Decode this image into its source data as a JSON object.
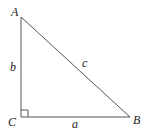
{
  "diagram": {
    "type": "right-triangle",
    "vertices": {
      "A": {
        "label": "A",
        "x": 21,
        "y": 17
      },
      "B": {
        "label": "B",
        "x": 130,
        "y": 117
      },
      "C": {
        "label": "C",
        "x": 21,
        "y": 117
      }
    },
    "sides": {
      "a": {
        "label": "a",
        "from": "C",
        "to": "B"
      },
      "b": {
        "label": "b",
        "from": "C",
        "to": "A"
      },
      "c": {
        "label": "c",
        "from": "A",
        "to": "B"
      }
    },
    "right_angle_at": "C",
    "colors": {
      "stroke": "#555555",
      "text": "#222222",
      "background": "#ffffff"
    }
  }
}
